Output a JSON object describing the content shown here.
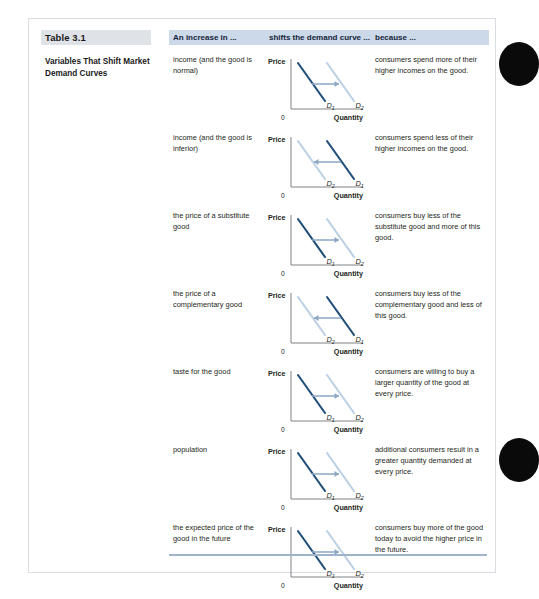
{
  "table": {
    "number": "Table 3.1",
    "title": "Variables That Shift Market Demand Curves",
    "headers": {
      "cause": "An increase in ...",
      "shift": "shifts the demand curve ...",
      "because": "because ..."
    },
    "axis": {
      "y_label": "Price",
      "x_label": "Quantity",
      "origin": "0"
    },
    "curve_labels": {
      "d1": "D",
      "d1_sub": "1",
      "d2": "D",
      "d2_sub": "2"
    },
    "colors": {
      "curve_dark": "#1f4e79",
      "curve_light": "#bcd0e4",
      "arrow": "#8ba7c4",
      "header_band": "#ccd9e8",
      "title_band": "#dfe3e8",
      "axis": "#6f7479",
      "bottom_rule": "#9fb4cc",
      "edge_tab": "#0a0a0a"
    },
    "rows": [
      {
        "cause": "income (and the good is normal)",
        "shift_direction": "right",
        "because": "consumers spend more of their higher incomes on the good."
      },
      {
        "cause": "income (and the good is inferior)",
        "shift_direction": "left",
        "because": "consumers spend less of their higher incomes on the good."
      },
      {
        "cause": "the price of a substitute good",
        "shift_direction": "right",
        "because": "consumers buy less of the substitute good and more of this good."
      },
      {
        "cause": "the price of a complementary good",
        "shift_direction": "left",
        "because": "consumers buy less of the complementary good and less of this good."
      },
      {
        "cause": "taste for the good",
        "shift_direction": "right",
        "because": "consumers are willing to buy a larger quantity of the good at every price."
      },
      {
        "cause": "population",
        "shift_direction": "right",
        "because": "additional consumers result in a greater quantity demanded at every price."
      },
      {
        "cause": "the expected price of the good in the future",
        "shift_direction": "right",
        "because": "consumers buy more of the good today to avoid the higher price in the future."
      }
    ]
  }
}
